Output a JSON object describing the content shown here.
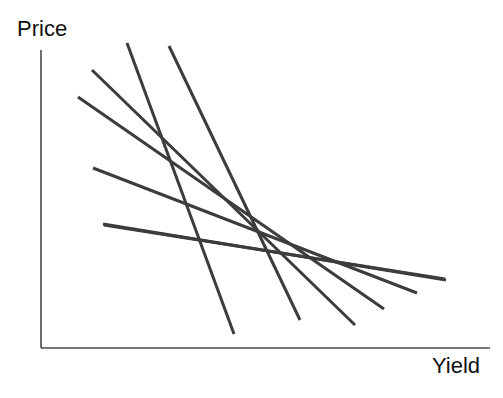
{
  "chart_data": {
    "type": "line",
    "title": "",
    "subtitle": "",
    "xlabel": "Yield",
    "ylabel": "Price",
    "grid": false,
    "legend": false,
    "legend_position": "none",
    "axis_style": "L-shaped spine, no ticks, no tick labels",
    "xlim": [
      0,
      1
    ],
    "ylim": [
      0,
      1
    ],
    "x_tick_labels": [],
    "y_tick_labels": [],
    "annotations": [],
    "line_color": "#3c3c3c",
    "line_width": 3,
    "axis_color": "#4a4a4a",
    "background_color": "#ffffff",
    "series": [
      {
        "name": "curve-1-steepest",
        "points": [
          [
            127,
            43
          ],
          [
            234,
            334
          ]
        ]
      },
      {
        "name": "curve-2-steep",
        "points": [
          [
            169,
            46
          ],
          [
            300,
            320
          ]
        ]
      },
      {
        "name": "curve-3",
        "points": [
          [
            92,
            70
          ],
          [
            355,
            325
          ]
        ]
      },
      {
        "name": "curve-4",
        "points": [
          [
            78,
            97
          ],
          [
            384,
            309
          ]
        ]
      },
      {
        "name": "curve-5",
        "points": [
          [
            93,
            168
          ],
          [
            417,
            293
          ]
        ]
      },
      {
        "name": "curve-6-flat",
        "points": [
          [
            103,
            224
          ],
          [
            446,
            280
          ]
        ]
      },
      {
        "name": "curve-7-mid",
        "points": [
          [
            104,
            225
          ],
          [
            445,
            279
          ]
        ]
      }
    ],
    "axes_geometry": {
      "origin": [
        41,
        348
      ],
      "y_axis_top": [
        41,
        50
      ],
      "x_axis_right": [
        490,
        348
      ]
    }
  },
  "figure": {
    "width": 503,
    "height": 398
  }
}
